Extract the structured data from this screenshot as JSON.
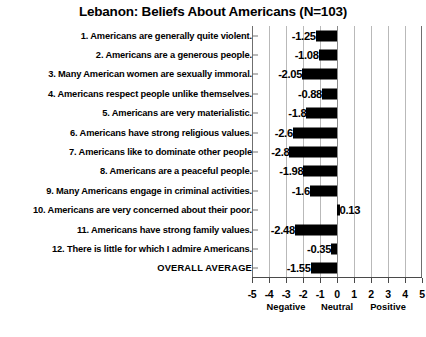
{
  "chart_data": {
    "type": "bar",
    "orientation": "horizontal",
    "title": "Lebanon: Beliefs About Americans (N=103)",
    "xlabel": "",
    "ylabel": "",
    "xlim": [
      -5,
      5
    ],
    "grid": true,
    "legend": null,
    "xticks": [
      -5,
      -4,
      -3,
      -2,
      -1,
      0,
      1,
      2,
      3,
      4,
      5
    ],
    "xticklabels": [
      "-5",
      "-4",
      "-3",
      "-2",
      "-1",
      "0",
      "1",
      "2",
      "3",
      "4",
      "5"
    ],
    "zone_annotations": [
      {
        "label": "Negative",
        "at": -3
      },
      {
        "label": "Neutral",
        "at": 0
      },
      {
        "label": "Positive",
        "at": 3
      }
    ],
    "categories": [
      "1. Americans are generally quite violent.",
      "2. Americans are a generous people.",
      "3. Many American women are sexually immoral.",
      "4. Americans respect people unlike themselves.",
      "5. Americans are very materialistic.",
      "6. Americans have strong religious values.",
      "7. Americans like to dominate other people",
      "8. Americans are a peaceful people.",
      "9. Many Americans engage in criminal activities.",
      "10. Americans are very concerned about their poor.",
      "11. Americans have strong family values.",
      "12. There is little for which I admire Americans.",
      "OVERALL AVERAGE"
    ],
    "values": [
      -1.25,
      -1.08,
      -2.05,
      -0.88,
      -1.8,
      -2.6,
      -2.8,
      -1.98,
      -1.6,
      0.13,
      -2.48,
      -0.35,
      -1.55
    ],
    "value_labels": [
      "-1.25",
      "-1.08",
      "-2.05",
      "-0.88",
      "-1.8",
      "-2.6",
      "-2.8",
      "-1.98",
      "-1.6",
      "0.13",
      "-2.48",
      "-0.35",
      "-1.55"
    ],
    "bar_color": "#000000"
  }
}
